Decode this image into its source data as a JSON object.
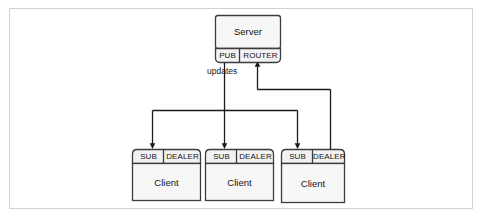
{
  "figure": {
    "frame_color": "#d2d2d2",
    "line_color": "#1a1a1a",
    "box_fill": "#f2f2f2",
    "box_stroke": "#3c3c3c",
    "body_fill": "#f7f7f7"
  },
  "server": {
    "label": "Server",
    "ports": [
      {
        "label": "PUB",
        "role": "publish"
      },
      {
        "label": "ROUTER",
        "role": "route"
      }
    ]
  },
  "clients": [
    {
      "label": "Client",
      "ports": [
        {
          "label": "SUB",
          "role": "subscribe"
        },
        {
          "label": "DEALER",
          "role": "deal"
        }
      ]
    },
    {
      "label": "Client",
      "ports": [
        {
          "label": "SUB",
          "role": "subscribe"
        },
        {
          "label": "DEALER",
          "role": "deal"
        }
      ]
    },
    {
      "label": "Client",
      "ports": [
        {
          "label": "SUB",
          "role": "subscribe"
        },
        {
          "label": "DEALER",
          "role": "deal"
        }
      ]
    }
  ],
  "edges": [
    {
      "name": "pub-fanout",
      "label": "updates",
      "from": "server.PUB",
      "to": [
        "client1.SUB",
        "client2.SUB",
        "client3.SUB"
      ],
      "direction": "downstream"
    },
    {
      "name": "dealer-to-router",
      "label": "",
      "from": "client3.DEALER",
      "to": [
        "server.ROUTER"
      ],
      "direction": "upstream"
    }
  ]
}
